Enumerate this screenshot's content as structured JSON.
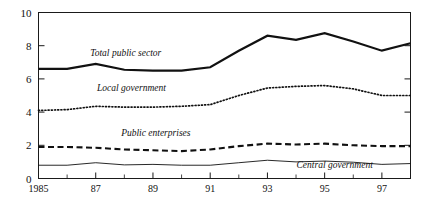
{
  "chart_data": {
    "type": "line",
    "title": "",
    "xlabel": "",
    "ylabel": "",
    "xlim": [
      1985,
      1998
    ],
    "ylim": [
      0,
      10
    ],
    "yticks": [
      "0",
      "2",
      "4",
      "6",
      "8",
      "10"
    ],
    "ytick_values": [
      0,
      2,
      4,
      6,
      8,
      10
    ],
    "xticks": [
      "1985",
      "87",
      "89",
      "91",
      "93",
      "95",
      "97"
    ],
    "xtick_values": [
      1985,
      1987,
      1989,
      1991,
      1993,
      1995,
      1997
    ],
    "x": [
      1985,
      1986,
      1987,
      1988,
      1989,
      1990,
      1991,
      1992,
      1993,
      1994,
      1995,
      1996,
      1997,
      1998
    ],
    "grid": false,
    "legend_position": "inline-annotations",
    "series": [
      {
        "name": "Total public sector",
        "style": "solid-thick",
        "color": "#111111",
        "label_x": 1988.05,
        "label_y": 7.35,
        "values": [
          6.6,
          6.6,
          6.9,
          6.55,
          6.5,
          6.5,
          6.7,
          7.7,
          8.6,
          8.35,
          8.75,
          8.25,
          7.7,
          8.15
        ]
      },
      {
        "name": "Local government",
        "style": "dotted",
        "color": "#111111",
        "label_x": 1988.25,
        "label_y": 5.25,
        "values": [
          4.1,
          4.15,
          4.35,
          4.3,
          4.3,
          4.35,
          4.45,
          5.0,
          5.45,
          5.55,
          5.6,
          5.4,
          5.0,
          5.0
        ]
      },
      {
        "name": "Public enterprises",
        "style": "dashed",
        "color": "#111111",
        "label_x": 1989.1,
        "label_y": 2.55,
        "values": [
          1.9,
          1.9,
          1.85,
          1.75,
          1.7,
          1.65,
          1.75,
          1.95,
          2.1,
          2.05,
          2.1,
          2.0,
          1.95,
          1.95
        ]
      },
      {
        "name": "Central government",
        "style": "solid-thin",
        "color": "#111111",
        "label_x": 1995.35,
        "label_y": 0.63,
        "values": [
          0.8,
          0.8,
          0.95,
          0.82,
          0.85,
          0.8,
          0.8,
          0.95,
          1.1,
          1.0,
          1.05,
          0.98,
          0.85,
          0.9
        ]
      }
    ]
  }
}
